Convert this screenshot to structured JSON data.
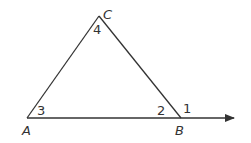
{
  "diagram": {
    "type": "triangle-exterior-angle",
    "vertices": {
      "A": {
        "label": "A",
        "x": 27,
        "y": 118
      },
      "B": {
        "label": "B",
        "x": 181,
        "y": 118
      },
      "C": {
        "label": "C",
        "x": 99,
        "y": 16
      }
    },
    "ray_end": {
      "x": 236,
      "y": 118
    },
    "angle_labels": [
      {
        "label": "1",
        "x": 183,
        "y": 113
      },
      {
        "label": "2",
        "x": 157,
        "y": 115
      },
      {
        "label": "3",
        "x": 37,
        "y": 115
      },
      {
        "label": "4",
        "x": 93,
        "y": 34
      }
    ],
    "point_labels": {
      "A": "A",
      "B": "B",
      "C": "C"
    },
    "line_color": "#333333"
  }
}
